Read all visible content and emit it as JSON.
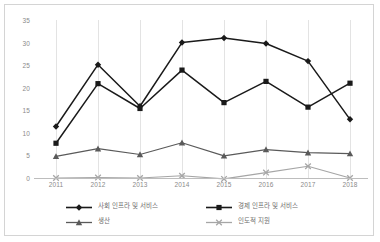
{
  "chart_data": {
    "type": "line",
    "title": "",
    "xlabel": "",
    "ylabel": "",
    "categories": [
      "2011",
      "2012",
      "2013",
      "2014",
      "2015",
      "2016",
      "2017",
      "2018"
    ],
    "ylim": [
      0,
      35
    ],
    "yticks": [
      "0",
      "5",
      "10",
      "15",
      "20",
      "25",
      "30",
      "35"
    ],
    "grid": "vertical",
    "legend_position": "bottom",
    "series": [
      {
        "name": "사회 인프라 및 서비스",
        "marker": "diamond",
        "color": "#1a1a1a",
        "values": [
          11.4,
          25.1,
          15.9,
          30.0,
          31.0,
          29.8,
          25.9,
          13.0
        ]
      },
      {
        "name": "경제 인프라 및 서비스",
        "marker": "square",
        "color": "#1a1a1a",
        "values": [
          7.7,
          20.9,
          15.4,
          23.9,
          16.7,
          21.4,
          15.7,
          21.0
        ]
      },
      {
        "name": "생산",
        "marker": "triangle",
        "color": "#5a5a5a",
        "values": [
          4.8,
          6.5,
          5.2,
          7.8,
          4.9,
          6.3,
          5.6,
          5.4
        ]
      },
      {
        "name": "인도적 지원",
        "marker": "x",
        "color": "#a6a6a6",
        "values": [
          0.0,
          0.1,
          0.0,
          0.5,
          -0.2,
          1.2,
          2.6,
          0.0
        ]
      }
    ]
  }
}
